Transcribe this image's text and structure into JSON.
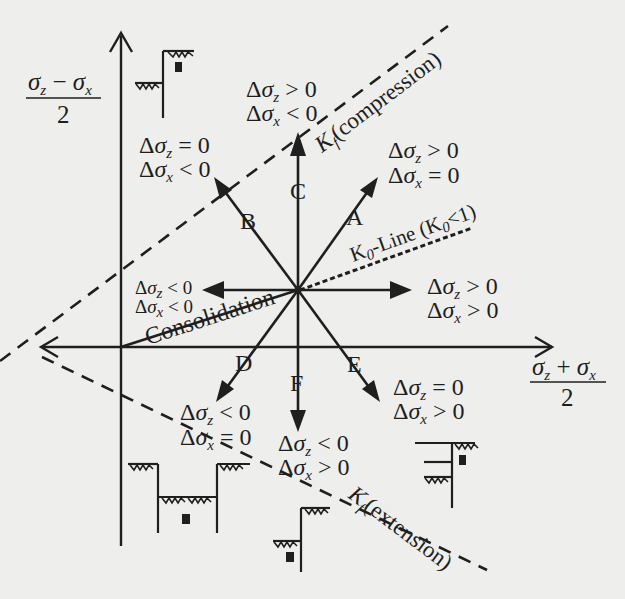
{
  "figure": {
    "axes": {
      "y_label": {
        "numerator": "σ_z − σ_x",
        "denominator": "2",
        "num_left": "σ",
        "num_left_sub": "z",
        "num_op": " − ",
        "num_right": "σ",
        "num_right_sub": "x"
      },
      "x_label": {
        "numerator": "σ_z + σ_x",
        "denominator": "2",
        "num_left": "σ",
        "num_left_sub": "z",
        "num_op": " + ",
        "num_right": "σ",
        "num_right_sub": "x"
      }
    },
    "lines": {
      "kf_compression": {
        "label_k": "K",
        "label_k_sub": "f",
        "label_text": "(compression)"
      },
      "kf_extension": {
        "label_k": "K",
        "label_k_sub": "f",
        "label_text": "(extension)"
      },
      "k0_line": {
        "label": "K",
        "label_sub": "0",
        "label_rest": "-Line (K",
        "label_sub2": "0",
        "label_end": "<1)"
      },
      "consolidation": {
        "label": "Consolidation"
      }
    },
    "paths": [
      {
        "id": "A",
        "letter": "A",
        "dsz_op": ">",
        "dsx_op": "="
      },
      {
        "id": "B",
        "letter": "B",
        "dsz_op": "=",
        "dsx_op": "<"
      },
      {
        "id": "C",
        "letter": "C",
        "dsz_op": ">",
        "dsx_op": "<"
      },
      {
        "id": "D",
        "letter": "D",
        "dsz_op": "<",
        "dsx_op": "="
      },
      {
        "id": "E",
        "letter": "E",
        "dsz_op": "=",
        "dsx_op": ">"
      },
      {
        "id": "F",
        "letter": "F",
        "dsz_op": "<",
        "dsx_op": ">"
      },
      {
        "id": "right",
        "letter": "",
        "dsz_op": ">",
        "dsx_op": ">"
      },
      {
        "id": "left",
        "letter": "",
        "dsz_op": "<",
        "dsx_op": "<"
      }
    ],
    "symbols": {
      "delta": "Δ",
      "sigma": "σ",
      "sub_z": "z",
      "sub_x": "x",
      "zero": "0"
    },
    "conditions_text": {
      "A": [
        "Δσz > 0",
        "Δσx = 0"
      ],
      "B": [
        "Δσz = 0",
        "Δσx < 0"
      ],
      "C": [
        "Δσz > 0",
        "Δσx < 0"
      ],
      "D": [
        "Δσz < 0",
        "Δσx = 0"
      ],
      "E": [
        "Δσz = 0",
        "Δσx > 0"
      ],
      "F": [
        "Δσz < 0",
        "Δσx > 0"
      ],
      "right": [
        "Δσz > 0",
        "Δσx > 0"
      ],
      "left": [
        "Δσz < 0",
        "Δσx < 0"
      ]
    },
    "sketches": [
      {
        "id": "top-left",
        "description": "excavation step wall with element"
      },
      {
        "id": "bottom-left",
        "description": "excavation pit with element at base"
      },
      {
        "id": "bottom-right",
        "description": "retaining wall with element behind"
      },
      {
        "id": "right",
        "description": "wall with struts and element"
      }
    ]
  }
}
